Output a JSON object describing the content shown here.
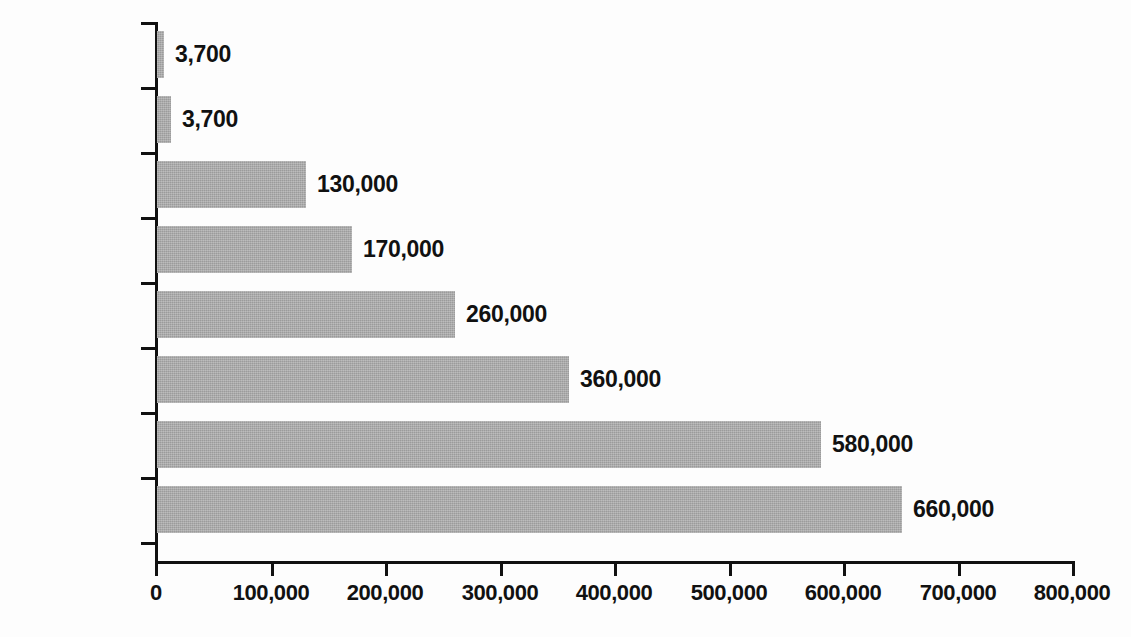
{
  "chart_data": {
    "type": "bar",
    "orientation": "horizontal",
    "title": "",
    "subtitle": "",
    "xlabel": "",
    "ylabel": "",
    "categories": [
      "Laos",
      "Philippines",
      "Cambodia",
      "Indonesia",
      "Vietnam",
      "Myanmar",
      "Thailand",
      "China"
    ],
    "values": [
      3700,
      3700,
      130000,
      170000,
      260000,
      360000,
      580000,
      660000
    ],
    "value_labels": [
      "3,700",
      "3,700",
      "130,000",
      "170,000",
      "260,000",
      "360,000",
      "580,000",
      "660,000"
    ],
    "xlim": [
      0,
      800000
    ],
    "x_ticks": [
      0,
      100000,
      200000,
      300000,
      400000,
      500000,
      600000,
      700000,
      800000
    ],
    "x_tick_labels": [
      "0",
      "100,000",
      "200,000",
      "300,000",
      "400,000",
      "500,000",
      "600,000",
      "700,000",
      "800,000"
    ],
    "grid": false,
    "legend": false,
    "legend_position": "none",
    "bar_color": "#a9a9a9",
    "axis_color": "#111111",
    "text_color": "#111111",
    "background_color": "#fdfdfd",
    "bar_pixel_widths": [
      7,
      14,
      149,
      195,
      298,
      412,
      664,
      745
    ]
  }
}
